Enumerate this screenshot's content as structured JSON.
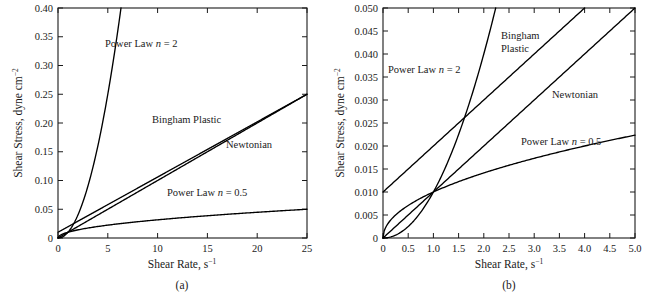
{
  "figure": {
    "panels": [
      {
        "caption": "(a)",
        "xlabel_main": "Shear Rate, s",
        "xlabel_sup": "−1",
        "ylabel_main": "Shear Stress, dyne cm",
        "ylabel_sup": "−2",
        "xticks": [
          "0",
          "5",
          "10",
          "15",
          "20",
          "25"
        ],
        "yticks": [
          "0",
          "0.05",
          "0.10",
          "0.15",
          "0.20",
          "0.25",
          "0.30",
          "0.35",
          "0.40"
        ],
        "labels": [
          {
            "text_pre": "Power Law ",
            "text_ital": "n",
            "text_post": " = 2"
          },
          {
            "text_pre": "Bingham Plastic",
            "text_ital": "",
            "text_post": ""
          },
          {
            "text_pre": "Newtonian",
            "text_ital": "",
            "text_post": ""
          },
          {
            "text_pre": "Power Law ",
            "text_ital": "n",
            "text_post": " = 0.5"
          }
        ]
      },
      {
        "caption": "(b)",
        "xlabel_main": "Shear Rate, s",
        "xlabel_sup": "−1",
        "ylabel_main": "Shear Stress, dyne cm",
        "ylabel_sup": "−2",
        "xticks": [
          "0",
          "0.5",
          "1.0",
          "1.5",
          "2.0",
          "2.5",
          "3.0",
          "3.5",
          "4.0",
          "4.5",
          "5.0"
        ],
        "yticks": [
          "0",
          "0.005",
          "0.010",
          "0.015",
          "0.020",
          "0.025",
          "0.030",
          "0.035",
          "0.040",
          "0.045",
          "0.050"
        ],
        "labels": [
          {
            "text_pre": "Power Law ",
            "text_ital": "n",
            "text_post": " = 2"
          },
          {
            "text_pre": "Bingham",
            "text_ital": "",
            "text_post": ""
          },
          {
            "text_pre": "Plastic",
            "text_ital": "",
            "text_post": ""
          },
          {
            "text_pre": "Newtonian",
            "text_ital": "",
            "text_post": ""
          },
          {
            "text_pre": "Power Law ",
            "text_ital": "n",
            "text_post": " = 0.5"
          }
        ]
      }
    ]
  },
  "chart_data": [
    {
      "type": "line",
      "title": "(a)",
      "xlabel": "Shear Rate, s^-1",
      "ylabel": "Shear Stress, dyne cm^-2",
      "xlim": [
        0,
        25
      ],
      "ylim": [
        0,
        0.4
      ],
      "xticks": [
        0,
        5,
        10,
        15,
        20,
        25
      ],
      "yticks": [
        0,
        0.05,
        0.1,
        0.15,
        0.2,
        0.25,
        0.3,
        0.35,
        0.4
      ],
      "grid": false,
      "legend": "inline-annotations",
      "series": [
        {
          "name": "Power Law n = 2",
          "model": "tau = 0.010 * gammadot^2",
          "x": [
            0,
            0.5,
            1,
            1.5,
            2,
            2.5,
            3,
            3.5,
            4,
            4.5,
            5,
            5.5,
            6,
            6.32
          ],
          "y": [
            0,
            0.0025,
            0.01,
            0.0225,
            0.04,
            0.0625,
            0.09,
            0.1225,
            0.16,
            0.2025,
            0.25,
            0.3025,
            0.36,
            0.4
          ]
        },
        {
          "name": "Bingham Plastic",
          "model": "tau = 0.010 + 0.0096 * gammadot",
          "x": [
            0,
            5,
            10,
            15,
            20,
            25
          ],
          "y": [
            0.01,
            0.058,
            0.106,
            0.154,
            0.202,
            0.25
          ]
        },
        {
          "name": "Newtonian",
          "model": "tau = 0.010 * gammadot",
          "x": [
            0,
            5,
            10,
            15,
            20,
            25
          ],
          "y": [
            0,
            0.05,
            0.1,
            0.15,
            0.2,
            0.25
          ]
        },
        {
          "name": "Power Law n = 0.5",
          "model": "tau = 0.010 * gammadot^0.5",
          "x": [
            0,
            1,
            2,
            5,
            10,
            15,
            20,
            25
          ],
          "y": [
            0,
            0.01,
            0.0141,
            0.0224,
            0.0316,
            0.0387,
            0.0447,
            0.05
          ]
        }
      ]
    },
    {
      "type": "line",
      "title": "(b)",
      "xlabel": "Shear Rate, s^-1",
      "ylabel": "Shear Stress, dyne cm^-2",
      "xlim": [
        0,
        5.0
      ],
      "ylim": [
        0,
        0.05
      ],
      "xticks": [
        0,
        0.5,
        1.0,
        1.5,
        2.0,
        2.5,
        3.0,
        3.5,
        4.0,
        4.5,
        5.0
      ],
      "yticks": [
        0,
        0.005,
        0.01,
        0.015,
        0.02,
        0.025,
        0.03,
        0.035,
        0.04,
        0.045,
        0.05
      ],
      "grid": false,
      "legend": "inline-annotations",
      "series": [
        {
          "name": "Power Law n = 2",
          "model": "tau = 0.010 * gammadot^2",
          "x": [
            0,
            0.25,
            0.5,
            0.75,
            1.0,
            1.25,
            1.5,
            1.75,
            2.0,
            2.236
          ],
          "y": [
            0,
            0.000625,
            0.0025,
            0.005625,
            0.01,
            0.015625,
            0.0225,
            0.030625,
            0.04,
            0.05
          ]
        },
        {
          "name": "Bingham Plastic",
          "model": "tau = 0.010 + 0.0100 * gammadot",
          "x": [
            0,
            1.0,
            2.0,
            3.0,
            4.0
          ],
          "y": [
            0.01,
            0.02,
            0.03,
            0.04,
            0.05
          ]
        },
        {
          "name": "Newtonian",
          "model": "tau = 0.010 * gammadot",
          "x": [
            0,
            1.0,
            2.0,
            3.0,
            4.0,
            5.0
          ],
          "y": [
            0,
            0.01,
            0.02,
            0.03,
            0.04,
            0.05
          ]
        },
        {
          "name": "Power Law n = 0.5",
          "model": "tau = 0.010 * gammadot^0.5",
          "x": [
            0,
            0.25,
            0.5,
            1.0,
            1.5,
            2.0,
            3.0,
            4.0,
            5.0
          ],
          "y": [
            0,
            0.005,
            0.00707,
            0.01,
            0.01225,
            0.01414,
            0.01732,
            0.02,
            0.02236
          ]
        }
      ]
    }
  ]
}
